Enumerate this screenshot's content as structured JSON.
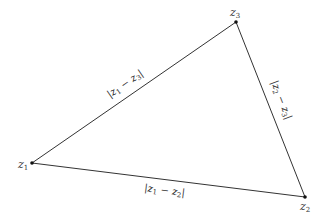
{
  "diagram": {
    "type": "triangle",
    "stroke_color": "#333333",
    "background": "#ffffff",
    "vertices": [
      {
        "id": "z1",
        "label": "z",
        "sub": "1",
        "x": 32,
        "y": 163
      },
      {
        "id": "z2",
        "label": "z",
        "sub": "2",
        "x": 305,
        "y": 197
      },
      {
        "id": "z3",
        "label": "z",
        "sub": "3",
        "x": 236,
        "y": 22
      }
    ],
    "edges": [
      {
        "from": "z1",
        "to": "z3",
        "label": "|z1 − z3|",
        "parts": [
          "|z",
          "1",
          " − z",
          "3",
          "|"
        ]
      },
      {
        "from": "z2",
        "to": "z3",
        "label": "|z2 − z3|",
        "parts": [
          "|z",
          "2",
          " − z",
          "3",
          "|"
        ]
      },
      {
        "from": "z1",
        "to": "z2",
        "label": "|z1 − z2|",
        "parts": [
          "|z",
          "1",
          " − z",
          "2",
          "|"
        ]
      }
    ]
  }
}
